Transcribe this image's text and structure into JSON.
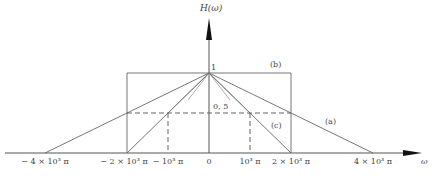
{
  "diagram": {
    "y_axis_label": "H(ω)",
    "x_axis_label": "ω",
    "peak_label": "1",
    "half_label": "0, 5",
    "curve_labels": {
      "a": "(a)",
      "b": "(b)",
      "c": "(c)"
    },
    "x_ticks": [
      {
        "label": "− 4 × 10³ π",
        "value": -4000
      },
      {
        "label": "− 2 × 10³ π",
        "value": -2000
      },
      {
        "label": "− 10³ π",
        "value": -1000
      },
      {
        "label": "0",
        "value": 0
      },
      {
        "label": "10³ π",
        "value": 1000
      },
      {
        "label": "2 × 10³ π",
        "value": 2000
      },
      {
        "label": "4 × 10³ π",
        "value": 4000
      }
    ],
    "curves": [
      {
        "name": "(a)",
        "shape": "triangle",
        "half_width": "4×10³π",
        "peak": 1
      },
      {
        "name": "(b)",
        "shape": "rectangle",
        "half_width": "2×10³π",
        "height": 1
      },
      {
        "name": "(c)",
        "shape": "triangle",
        "half_width": "2×10³π",
        "peak": 1
      }
    ],
    "line_color": "#555555"
  }
}
